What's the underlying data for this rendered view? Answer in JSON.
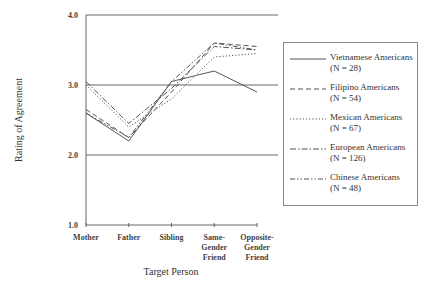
{
  "chart_data": {
    "type": "line",
    "title": "",
    "xlabel": "Target Person",
    "ylabel": "Rating of Agreement",
    "ylim": [
      1.0,
      4.0
    ],
    "yticks": [
      "1.0",
      "2.0",
      "3.0",
      "4.0"
    ],
    "grid": "horizontal at 2.0, 3.0, 4.0",
    "legend_position": "right",
    "categories": [
      "Mother",
      "Father",
      "Sibling",
      "Same-Gender Friend",
      "Opposite-Gender Friend"
    ],
    "category_lines": [
      [
        "Mother"
      ],
      [
        "Father"
      ],
      [
        "Sibling"
      ],
      [
        "Same-",
        "Gender",
        "Friend"
      ],
      [
        "Opposite-",
        "Gender",
        "Friend"
      ]
    ],
    "series": [
      {
        "name": "Vietnamese Americans",
        "n_label": "(N = 28)",
        "style": "solid",
        "values": [
          2.6,
          2.2,
          3.05,
          3.2,
          2.9
        ]
      },
      {
        "name": "Filipino Americans",
        "n_label": "(N = 54)",
        "style": "dashed",
        "values": [
          2.65,
          2.25,
          2.9,
          3.6,
          3.55
        ]
      },
      {
        "name": "Mexican Americans",
        "n_label": "(N = 67)",
        "style": "dotted",
        "values": [
          3.0,
          2.4,
          2.8,
          3.4,
          3.45
        ]
      },
      {
        "name": "European Americans",
        "n_label": "(N = 126)",
        "style": "dash-dot",
        "values": [
          3.05,
          2.45,
          2.95,
          3.55,
          3.5
        ]
      },
      {
        "name": "Chinese Americans",
        "n_label": "(N = 48)",
        "style": "dash-dot-dot",
        "values": [
          2.6,
          2.25,
          3.05,
          3.6,
          3.5
        ]
      }
    ]
  },
  "colors": {
    "line": "#555555",
    "grid": "#666666",
    "text": "#333333"
  }
}
